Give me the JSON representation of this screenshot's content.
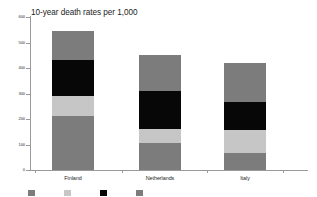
{
  "chart_data": {
    "type": "bar",
    "subtype": "stacked-column",
    "title": "10-year death rates per 1,000",
    "xlabel": "",
    "ylabel": "",
    "ylim": [
      0,
      600
    ],
    "yticks": [
      0,
      100,
      200,
      300,
      400,
      500,
      600
    ],
    "ytick_labels": [
      "0",
      "100",
      "200",
      "300",
      "400",
      "500",
      "600"
    ],
    "grid": false,
    "legend_position": "bottom",
    "categories": [
      "Finland",
      "Netherlands",
      "Italy"
    ],
    "series": [
      {
        "name": "Series 1",
        "key": "s1",
        "color": "#7c7c7c",
        "values": [
          210,
          105,
          65
        ]
      },
      {
        "name": "Series 2",
        "key": "s2",
        "color": "#c6c6c6",
        "values": [
          80,
          55,
          90
        ]
      },
      {
        "name": "Series 3",
        "key": "s3",
        "color": "#070707",
        "values": [
          140,
          150,
          110
        ]
      },
      {
        "name": "Series 4",
        "key": "s4",
        "color": "#7c7c7c",
        "values": [
          115,
          140,
          155
        ]
      }
    ],
    "totals": [
      545,
      450,
      420
    ],
    "legend_entries": [
      "",
      "",
      "",
      ""
    ],
    "colors": {
      "gray": "#7c7c7c",
      "light_gray": "#c6c6c6",
      "black": "#070707",
      "axis": "#9a9a9a",
      "background": "#ffffff",
      "text": "#1c1c1c"
    }
  },
  "axis": {
    "y_labels": [
      "600",
      "500",
      "400",
      "300",
      "200",
      "100",
      "0"
    ]
  }
}
